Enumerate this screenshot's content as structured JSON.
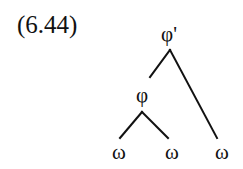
{
  "example_number": "(6.44)",
  "tree": {
    "root": {
      "label": "φ'",
      "x": 169,
      "y": 40
    },
    "inner": {
      "label": "φ",
      "x": 142,
      "y": 101
    },
    "leaves": [
      {
        "label": "ω",
        "x": 119,
        "y": 157
      },
      {
        "label": "ω",
        "x": 172,
        "y": 157
      },
      {
        "label": "ω",
        "x": 222,
        "y": 157
      }
    ]
  }
}
